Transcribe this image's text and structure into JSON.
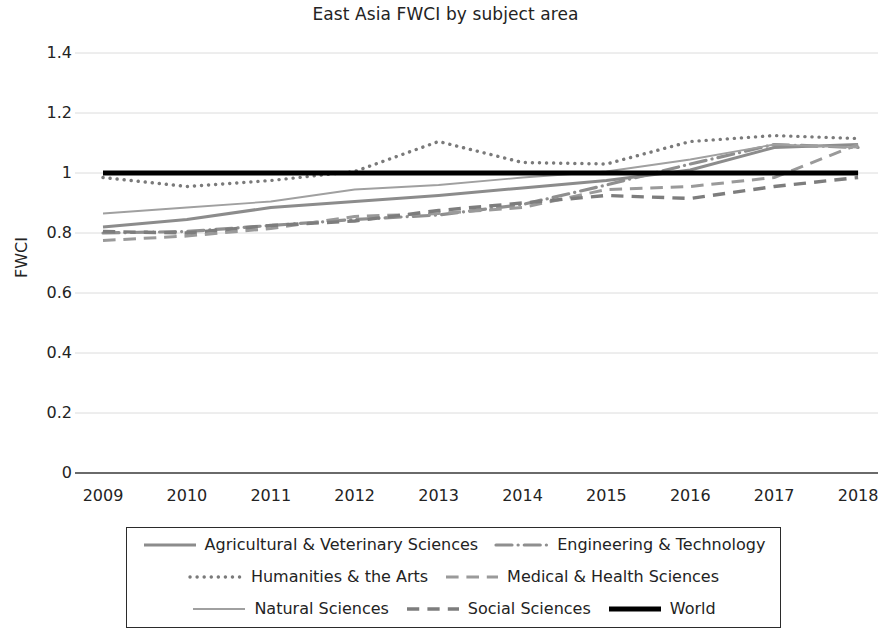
{
  "chart_data": {
    "type": "line",
    "title": "East Asia FWCI by subject area",
    "xlabel": "",
    "ylabel": "FWCI",
    "categories": [
      2009,
      2010,
      2011,
      2012,
      2013,
      2014,
      2015,
      2016,
      2017,
      2018
    ],
    "x_tick_labels": [
      "2009",
      "2010",
      "2011",
      "2012",
      "2013",
      "2014",
      "2015",
      "2016",
      "2017",
      "2018"
    ],
    "y_tick_labels": [
      "1.4",
      "1.2",
      "1",
      "0.8",
      "0.6",
      "0.4",
      "0.2",
      "0"
    ],
    "y_tick_values": [
      1.4,
      1.2,
      1.0,
      0.8,
      0.6,
      0.4,
      0.2,
      0
    ],
    "ylim": [
      0,
      1.45
    ],
    "grid": true,
    "grid_axis": "y",
    "legend_position": "bottom",
    "series": [
      {
        "name": "Agricultural & Veterinary Sciences",
        "style": "solid",
        "color": "#8c8c8c",
        "width": 3.0,
        "values": [
          0.82,
          0.845,
          0.885,
          0.905,
          0.925,
          0.95,
          0.975,
          1.01,
          1.085,
          1.095
        ]
      },
      {
        "name": "Engineering & Technology",
        "style": "dashdot",
        "color": "#8f8f8f",
        "width": 3.2,
        "values": [
          0.8,
          0.805,
          0.825,
          0.845,
          0.86,
          0.895,
          0.96,
          1.03,
          1.095,
          1.085
        ]
      },
      {
        "name": "Humanities & the Arts",
        "style": "dotted",
        "color": "#7a7a7a",
        "width": 3.4,
        "values": [
          0.985,
          0.955,
          0.975,
          1.005,
          1.105,
          1.035,
          1.03,
          1.105,
          1.125,
          1.115
        ]
      },
      {
        "name": "Medical & Health Sciences",
        "style": "dashed",
        "color": "#9a9a9a",
        "width": 3.0,
        "values": [
          0.775,
          0.79,
          0.815,
          0.855,
          0.865,
          0.885,
          0.945,
          0.955,
          0.985,
          1.095
        ]
      },
      {
        "name": "Natural Sciences",
        "style": "solid-thin",
        "color": "#a0a0a0",
        "width": 1.8,
        "values": [
          0.865,
          0.885,
          0.905,
          0.945,
          0.96,
          0.985,
          1.005,
          1.045,
          1.095,
          1.085
        ]
      },
      {
        "name": "Social Sciences",
        "style": "dashed-long",
        "color": "#7d7d7d",
        "width": 3.4,
        "values": [
          0.805,
          0.8,
          0.825,
          0.84,
          0.875,
          0.9,
          0.925,
          0.915,
          0.955,
          0.985
        ]
      },
      {
        "name": "World",
        "style": "solid-thick",
        "color": "#000000",
        "width": 5.0,
        "values": [
          1.0,
          1.0,
          1.0,
          1.0,
          1.0,
          1.0,
          1.0,
          1.0,
          1.0,
          1.0
        ]
      }
    ]
  },
  "legend": {
    "rows": [
      [
        "Agricultural & Veterinary Sciences",
        "Engineering & Technology"
      ],
      [
        "Humanities & the Arts",
        "Medical & Health Sciences"
      ],
      [
        "Natural Sciences",
        "Social Sciences",
        "World"
      ]
    ]
  }
}
